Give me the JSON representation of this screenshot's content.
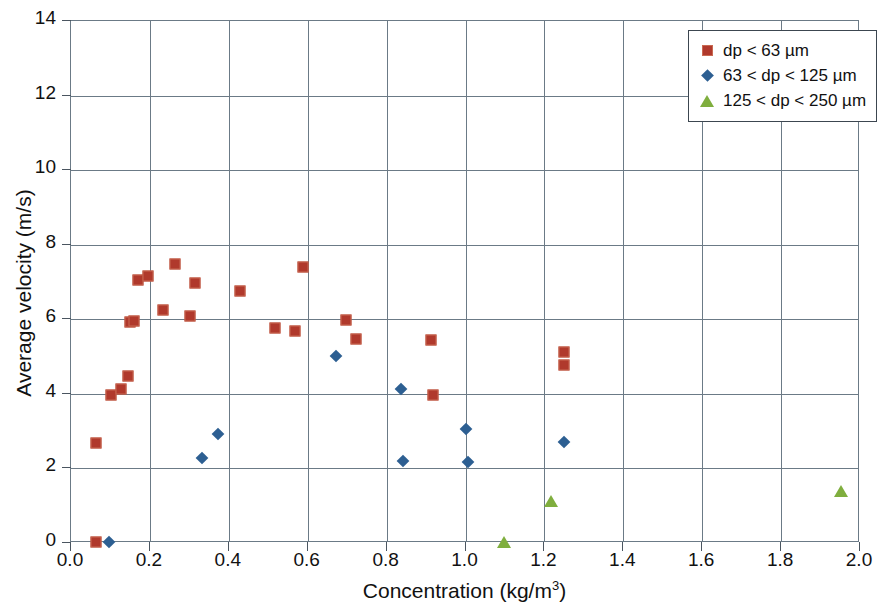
{
  "chart_data": {
    "type": "scatter",
    "title": "",
    "xlabel": "Concentration (kg/m3)",
    "xlabel_base": "Concentration (kg/m",
    "xlabel_sup": "3",
    "xlabel_tail": ")",
    "ylabel": "Average velocity (m/s)",
    "xlim": [
      0.0,
      2.0
    ],
    "ylim": [
      0,
      14
    ],
    "xticks": [
      "0.0",
      "0.2",
      "0.4",
      "0.6",
      "0.8",
      "1.0",
      "1.2",
      "1.4",
      "1.6",
      "1.8",
      "2.0"
    ],
    "xtick_values": [
      0.0,
      0.2,
      0.4,
      0.6,
      0.8,
      1.0,
      1.2,
      1.4,
      1.6,
      1.8,
      2.0
    ],
    "yticks": [
      "0",
      "2",
      "4",
      "6",
      "8",
      "10",
      "12",
      "14"
    ],
    "ytick_values": [
      0,
      2,
      4,
      6,
      8,
      10,
      12,
      14
    ],
    "grid": true,
    "grid_color": "#6b7a86",
    "legend_position": "top-right",
    "series": [
      {
        "name": "dp < 63 µm",
        "marker": "square",
        "color": "#b0392c",
        "points": [
          [
            0.065,
            0.0
          ],
          [
            0.067,
            2.65
          ],
          [
            0.105,
            3.95
          ],
          [
            0.13,
            4.1
          ],
          [
            0.147,
            4.45
          ],
          [
            0.152,
            5.9
          ],
          [
            0.162,
            5.92
          ],
          [
            0.172,
            7.03
          ],
          [
            0.197,
            7.13
          ],
          [
            0.237,
            6.22
          ],
          [
            0.265,
            7.45
          ],
          [
            0.305,
            6.05
          ],
          [
            0.318,
            6.95
          ],
          [
            0.43,
            6.72
          ],
          [
            0.52,
            5.75
          ],
          [
            0.57,
            5.65
          ],
          [
            0.59,
            7.37
          ],
          [
            0.7,
            5.95
          ],
          [
            0.725,
            5.45
          ],
          [
            0.915,
            5.42
          ],
          [
            0.92,
            3.95
          ],
          [
            1.253,
            5.1
          ],
          [
            1.253,
            4.75
          ]
        ]
      },
      {
        "name": "63 < dp < 125 µm",
        "marker": "diamond",
        "color": "#2d5f92",
        "points": [
          [
            0.1,
            0.0
          ],
          [
            0.335,
            2.25
          ],
          [
            0.375,
            2.9
          ],
          [
            0.675,
            5.0
          ],
          [
            0.84,
            4.1
          ],
          [
            0.843,
            2.17
          ],
          [
            1.005,
            3.02
          ],
          [
            1.008,
            2.15
          ],
          [
            1.253,
            2.67
          ]
        ]
      },
      {
        "name": "125 < dp < 250 µm",
        "marker": "triangle",
        "color": "#7fae3e",
        "points": [
          [
            1.1,
            0.0
          ],
          [
            1.22,
            1.1
          ],
          [
            1.955,
            1.37
          ]
        ]
      }
    ]
  },
  "legend": {
    "items": [
      {
        "label": "dp < 63 µm",
        "marker": "square"
      },
      {
        "label": "63 < dp < 125 µm",
        "marker": "diamond"
      },
      {
        "label": "125 < dp < 250 µm",
        "marker": "triangle"
      }
    ]
  }
}
